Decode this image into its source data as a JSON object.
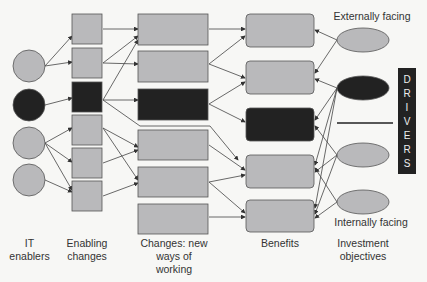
{
  "diagram": {
    "columns": {
      "it_enablers": "IT\nenablers",
      "enabling_changes": "Enabling\nchanges",
      "changes": "Changes: new\nways of\nworking",
      "benefits": "Benefits",
      "objectives": "Investment\nobjectives"
    },
    "labels": {
      "externally_facing": "Externally facing",
      "internally_facing": "Internally facing"
    },
    "drivers": [
      "D",
      "R",
      "I",
      "V",
      "E",
      "R",
      "S"
    ],
    "colors": {
      "grey": "#b9b9bb",
      "dark": "#222222",
      "line": "#444444"
    }
  }
}
